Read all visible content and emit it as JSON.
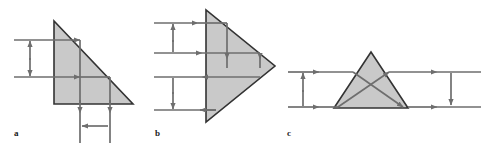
{
  "figure": {
    "background_color": "#ffffff",
    "prism_fill_color": "#c9c9c9",
    "prism_stroke_color": "#333333",
    "ray_color": "#6e6e6e",
    "label_color": "#1a1a1a",
    "panels": [
      {
        "id": "a",
        "label": "a",
        "prism_shape": "right-triangle-apex-top-left",
        "description": "Right triangle with vertical left face, horizontal bottom face and hypotenuse descending from top-left to bottom-right. Two horizontal rays enter from the left and exit downward through the base. A vertical double-headed arrow on the left marks the input beam separation; a horizontal double-headed arrow below the base marks the output beam separation.",
        "incoming_rays": 2,
        "outgoing_rays": 2,
        "outgoing_direction": "down",
        "dimension_arrows": [
          {
            "name": "input-separation",
            "orientation": "vertical",
            "position": "left"
          },
          {
            "name": "output-separation",
            "orientation": "horizontal",
            "position": "bottom"
          }
        ]
      },
      {
        "id": "b",
        "label": "b",
        "prism_shape": "triangle-apex-right",
        "description": "Triangle with a vertical left face and apex pointing right. Four horizontal rays enter from the left; the upper pair and the lower pair each carry a vertical double-headed separation arrow. Inside the prism two rays are deflected downward.",
        "incoming_rays": 4,
        "outgoing_rays": 2,
        "outgoing_direction": "down",
        "dimension_arrows": [
          {
            "name": "upper-input-separation",
            "orientation": "vertical",
            "position": "left-upper"
          },
          {
            "name": "lower-input-separation",
            "orientation": "vertical",
            "position": "left-lower"
          }
        ]
      },
      {
        "id": "c",
        "label": "c",
        "prism_shape": "triangle-apex-top",
        "description": "Isosceles triangle with horizontal base and apex at top. Two horizontal rays enter from the left, cross inside the prism and exit horizontally to the right. A vertical double-headed arrow on the left marks the input separation, and a downward arrow on the right marks the inverted output separation.",
        "incoming_rays": 2,
        "outgoing_rays": 2,
        "outgoing_direction": "right",
        "rays_cross_inside": true,
        "dimension_arrows": [
          {
            "name": "input-separation",
            "orientation": "vertical",
            "position": "left"
          },
          {
            "name": "output-separation",
            "orientation": "vertical",
            "position": "right"
          }
        ]
      }
    ]
  }
}
